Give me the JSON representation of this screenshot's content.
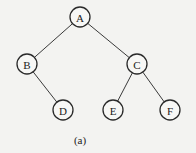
{
  "diagram": {
    "type": "binary-tree",
    "caption": "(a)",
    "caption_pos": {
      "x": 80,
      "y": 140
    },
    "node_radius": 10,
    "nodes": [
      {
        "id": "A",
        "label": "A",
        "x": 80,
        "y": 17
      },
      {
        "id": "B",
        "label": "B",
        "x": 27,
        "y": 64
      },
      {
        "id": "C",
        "label": "C",
        "x": 137,
        "y": 64
      },
      {
        "id": "D",
        "label": "D",
        "x": 63,
        "y": 110
      },
      {
        "id": "E",
        "label": "E",
        "x": 113,
        "y": 110
      },
      {
        "id": "F",
        "label": "F",
        "x": 170,
        "y": 110
      }
    ],
    "edges": [
      {
        "from": "A",
        "to": "B"
      },
      {
        "from": "A",
        "to": "C"
      },
      {
        "from": "B",
        "to": "D"
      },
      {
        "from": "C",
        "to": "E"
      },
      {
        "from": "C",
        "to": "F"
      }
    ]
  }
}
